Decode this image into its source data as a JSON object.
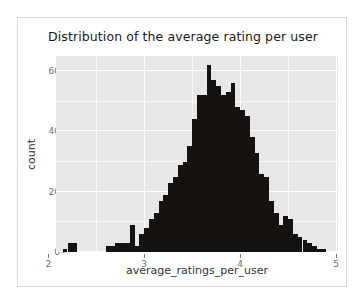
{
  "chart_data": {
    "type": "bar",
    "chart_subtype": "histogram",
    "title": "Distribution of the average rating per user",
    "xlabel": "average_ratings_per_user",
    "ylabel": "count",
    "xlim": [
      2.08,
      5.02
    ],
    "ylim": [
      0,
      65
    ],
    "xticks": [
      2,
      3,
      4,
      5
    ],
    "xtick_labels": [
      "2",
      "3",
      "4",
      "5"
    ],
    "yticks": [
      0,
      20,
      40,
      60
    ],
    "ytick_labels": [
      "0",
      "20",
      "40",
      "60"
    ],
    "grid": true,
    "grid_minor": true,
    "legend": "none",
    "bin_width": 0.05,
    "bar_color": "#16120f",
    "panel_color": "#e7e7e7",
    "grid_color": "#ffffff",
    "bin_starts": [
      2.15,
      2.2,
      2.25,
      2.6,
      2.65,
      2.7,
      2.75,
      2.8,
      2.85,
      2.9,
      2.95,
      3.0,
      3.05,
      3.1,
      3.15,
      3.2,
      3.25,
      3.3,
      3.35,
      3.4,
      3.45,
      3.5,
      3.55,
      3.6,
      3.65,
      3.7,
      3.75,
      3.8,
      3.85,
      3.9,
      3.95,
      4.0,
      4.05,
      4.1,
      4.15,
      4.2,
      4.25,
      4.3,
      4.35,
      4.4,
      4.45,
      4.5,
      4.55,
      4.6,
      4.65,
      4.7,
      4.75,
      4.8,
      4.85
    ],
    "values": [
      1,
      3,
      3,
      2,
      2,
      3,
      3,
      3,
      9,
      2,
      6,
      8,
      11,
      13,
      17,
      19,
      23,
      25,
      29,
      30,
      35,
      44,
      52,
      52,
      62,
      57,
      55,
      52,
      53,
      56,
      48,
      47,
      45,
      38,
      33,
      26,
      25,
      17,
      13,
      9,
      12,
      11,
      6,
      5,
      4,
      3,
      2,
      1,
      1
    ]
  },
  "figure": {
    "title": "Distribution of the average rating per user",
    "ylabel": "count",
    "xlabel": "average_ratings_per_user"
  }
}
